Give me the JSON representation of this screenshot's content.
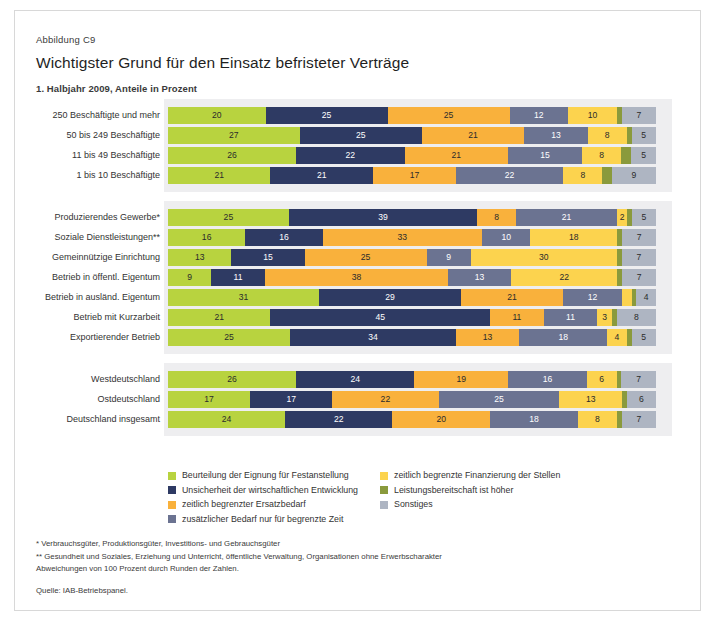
{
  "header": {
    "figure_number": "Abbildung C9",
    "title": "Wichtigster Grund für den Einsatz befristeter Verträge",
    "subtitle": "1. Halbjahr 2009, Anteile in Prozent"
  },
  "legend": {
    "column1": [
      {
        "label": "Beurteilung der Eignung für Festanstellung",
        "color": "#b8d33f"
      },
      {
        "label": "Unsicherheit der wirtschaftlichen Entwicklung",
        "color": "#2e3a63"
      },
      {
        "label": "zeitlich begrenzter Ersatzbedarf",
        "color": "#f9b13c"
      },
      {
        "label": "zusätzlicher Bedarf nur für begrenzte Zeit",
        "color": "#6b7391"
      }
    ],
    "column2": [
      {
        "label": "zeitlich begrenzte Finanzierung der Stellen",
        "color": "#fcd34e"
      },
      {
        "label": "Leistungsbereitschaft ist höher",
        "color": "#8a9a3c"
      },
      {
        "label": "Sonstiges",
        "color": "#aeb5c2"
      }
    ]
  },
  "notes": [
    "* Verbrauchsgüter, Produktionsgüter, Investitions- und Gebrauchsgüter",
    "** Gesundheit und Soziales, Erziehung und Unterricht, öffentliche Verwaltung, Organisationen ohne Erwerbscharakter",
    "Abweichungen von 100 Prozent durch Runden der Zahlen."
  ],
  "source": "Quelle: IAB-Betriebspanel.",
  "chart_data": {
    "type": "bar",
    "orientation": "horizontal",
    "stacked": true,
    "title": "Wichtigster Grund für den Einsatz befristeter Verträge",
    "subtitle": "1. Halbjahr 2009, Anteile in Prozent",
    "xlabel": "Anteile in Prozent",
    "ylabel": "",
    "xlim": [
      0,
      100
    ],
    "grid": false,
    "legend_position": "bottom",
    "series_names": [
      "Beurteilung der Eignung für Festanstellung",
      "Unsicherheit der wirtschaftlichen Entwicklung",
      "zeitlich begrenzter Ersatzbedarf",
      "zusätzlicher Bedarf nur für begrenzte Zeit",
      "zeitlich begrenzte Finanzierung der Stellen",
      "Leistungsbereitschaft ist höher",
      "Sonstiges"
    ],
    "series_colors": [
      "#b8d33f",
      "#2e3a63",
      "#f9b13c",
      "#6b7391",
      "#fcd34e",
      "#8a9a3c",
      "#aeb5c2"
    ],
    "groups": [
      {
        "name": "Betriebsgröße",
        "rows": [
          {
            "category": "250 Beschäftigte und mehr",
            "values": [
              20,
              25,
              25,
              12,
              10,
              1,
              7
            ],
            "labels": [
              "20",
              "25",
              "25",
              "12",
              "10",
              "",
              "7"
            ]
          },
          {
            "category": "50 bis 249 Beschäftigte",
            "values": [
              27,
              25,
              21,
              13,
              8,
              1,
              5
            ],
            "labels": [
              "27",
              "25",
              "21",
              "13",
              "8",
              "",
              "5"
            ]
          },
          {
            "category": "11 bis 49 Beschäftigte",
            "values": [
              26,
              22,
              21,
              15,
              8,
              2,
              5
            ],
            "labels": [
              "26",
              "22",
              "21",
              "15",
              "8",
              "",
              "5"
            ]
          },
          {
            "category": "1 bis 10 Beschäftigte",
            "values": [
              21,
              21,
              17,
              22,
              8,
              2,
              9
            ],
            "labels": [
              "21",
              "21",
              "17",
              "22",
              "8",
              "",
              "9"
            ]
          }
        ]
      },
      {
        "name": "Branche und Betriebsmerkmale",
        "rows": [
          {
            "category": "Produzierendes Gewerbe*",
            "values": [
              25,
              39,
              8,
              21,
              2,
              1,
              5
            ],
            "labels": [
              "25",
              "39",
              "8",
              "21",
              "2",
              "",
              "5"
            ]
          },
          {
            "category": "Soziale Dienstleistungen**",
            "values": [
              16,
              16,
              33,
              10,
              18,
              1,
              7
            ],
            "labels": [
              "16",
              "16",
              "33",
              "10",
              "18",
              "",
              "7"
            ]
          },
          {
            "category": "Gemeinnützige Einrichtung",
            "values": [
              13,
              15,
              25,
              9,
              30,
              1,
              7
            ],
            "labels": [
              "13",
              "15",
              "25",
              "9",
              "30",
              "",
              "7"
            ]
          },
          {
            "category": "Betrieb in öffentl. Eigentum",
            "values": [
              9,
              11,
              38,
              13,
              22,
              1,
              7
            ],
            "labels": [
              "9",
              "11",
              "38",
              "13",
              "22",
              "",
              "7"
            ]
          },
          {
            "category": "Betrieb in ausländ. Eigentum",
            "values": [
              31,
              29,
              21,
              12,
              2,
              1,
              4
            ],
            "labels": [
              "31",
              "29",
              "21",
              "12",
              "",
              "",
              "4"
            ]
          },
          {
            "category": "Betrieb mit Kurzarbeit",
            "values": [
              21,
              45,
              11,
              11,
              3,
              1,
              8
            ],
            "labels": [
              "21",
              "45",
              "11",
              "11",
              "3",
              "",
              "8"
            ]
          },
          {
            "category": "Exportierender Betrieb",
            "values": [
              25,
              34,
              13,
              18,
              4,
              1,
              5
            ],
            "labels": [
              "25",
              "34",
              "13",
              "18",
              "4",
              "",
              "5"
            ]
          }
        ]
      },
      {
        "name": "Region",
        "rows": [
          {
            "category": "Westdeutschland",
            "values": [
              26,
              24,
              19,
              16,
              6,
              1,
              7
            ],
            "labels": [
              "26",
              "24",
              "19",
              "16",
              "6",
              "",
              "7"
            ]
          },
          {
            "category": "Ostdeutschland",
            "values": [
              17,
              17,
              22,
              25,
              13,
              1,
              6
            ],
            "labels": [
              "17",
              "17",
              "22",
              "25",
              "13",
              "",
              "6"
            ]
          },
          {
            "category": "Deutschland insgesamt",
            "values": [
              24,
              22,
              20,
              18,
              8,
              1,
              7
            ],
            "labels": [
              "24",
              "22",
              "20",
              "18",
              "8",
              "",
              "7"
            ]
          }
        ]
      }
    ]
  }
}
